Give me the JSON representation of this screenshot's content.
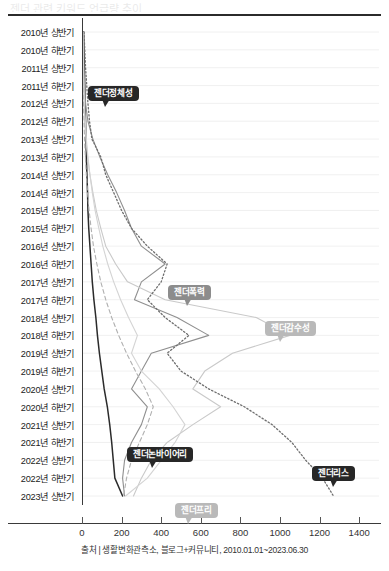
{
  "header": {
    "ghost_title": "젠더 관련 키워드 언급량 추이"
  },
  "source": {
    "text": "출처 | 생활변화관측소, 블로그+커뮤니티, 2010.01.01~2023.06.30"
  },
  "badges": [
    {
      "label": "젠더정체성",
      "style": "dark",
      "x": 88,
      "y": 68,
      "tail_x": 14,
      "tail_dir": "left-down"
    },
    {
      "label": "젠더폭력",
      "style": "mid",
      "x": 168,
      "y": 267,
      "tail_x": 16,
      "tail_dir": "left-down"
    },
    {
      "label": "젠더감수성",
      "style": "light",
      "x": 265,
      "y": 303,
      "tail_x": 12,
      "tail_dir": "left-down"
    },
    {
      "label": "젠더논바이어리",
      "style": "dark",
      "x": 127,
      "y": 429,
      "tail_x": 22,
      "tail_dir": "down"
    },
    {
      "label": "젠더리스",
      "style": "dark",
      "x": 312,
      "y": 448,
      "tail_x": 18,
      "tail_dir": "down"
    },
    {
      "label": "젠더프리",
      "style": "light",
      "x": 175,
      "y": 485,
      "tail_x": 10,
      "tail_dir": "left-up"
    }
  ],
  "chart_data": {
    "type": "line",
    "orientation": "horizontal",
    "title": "",
    "xlabel": "",
    "ylabel": "",
    "xlim": [
      0,
      1500
    ],
    "xticks": [
      0,
      200,
      400,
      600,
      800,
      1000,
      1200,
      1400
    ],
    "xtick_labels": [
      "0",
      "200",
      "400",
      "600",
      "800",
      "1000",
      "1200",
      "1400"
    ],
    "grid": true,
    "grid_axis": "y",
    "legend": "annotations",
    "categories": [
      "2010년 상반기",
      "2010년 하반기",
      "2011년 상반기",
      "2011년 하반기",
      "2012년 상반기",
      "2012년 하반기",
      "2013년 상반기",
      "2013년 하반기",
      "2014년 상반기",
      "2014년 하반기",
      "2015년 상반기",
      "2015년 하반기",
      "2016년 상반기",
      "2016년 하반기",
      "2017년 상반기",
      "2017년 하반기",
      "2018년 상반기",
      "2018년 하반기",
      "2019년 상반기",
      "2019년 하반기",
      "2020년 상반기",
      "2020년 하반기",
      "2021년 상반기",
      "2021년 하반기",
      "2022년 상반기",
      "2022년 하반기",
      "2023년 상반기"
    ],
    "series": [
      {
        "name": "젠더정체성",
        "line_style": "solid",
        "color": "#2b2b2b",
        "width": 1.5,
        "values": [
          8,
          10,
          12,
          14,
          16,
          18,
          20,
          22,
          25,
          28,
          30,
          34,
          40,
          46,
          52,
          60,
          70,
          78,
          88,
          100,
          112,
          128,
          140,
          150,
          158,
          166,
          205
        ]
      },
      {
        "name": "젠더폭력",
        "line_style": "solid",
        "color": "#8f8f8f",
        "width": 1.1,
        "values": [
          6,
          8,
          10,
          13,
          18,
          30,
          55,
          90,
          130,
          175,
          215,
          250,
          300,
          420,
          300,
          265,
          480,
          640,
          350,
          300,
          250,
          330,
          300,
          250,
          215,
          205,
          215
        ]
      },
      {
        "name": "젠더감수성",
        "line_style": "solid",
        "color": "#c9c9c9",
        "width": 1.1,
        "values": [
          4,
          5,
          6,
          8,
          10,
          14,
          20,
          28,
          40,
          55,
          72,
          95,
          120,
          170,
          230,
          420,
          880,
          1050,
          760,
          620,
          560,
          700,
          560,
          430,
          350,
          300,
          260
        ]
      },
      {
        "name": "젠더논바이어리",
        "line_style": "dashed",
        "color": "#b0b0b0",
        "width": 1.1,
        "values": [
          3,
          4,
          5,
          6,
          8,
          10,
          13,
          17,
          22,
          28,
          36,
          46,
          58,
          75,
          95,
          120,
          150,
          185,
          225,
          270,
          320,
          360,
          330,
          290,
          250,
          225,
          210
        ]
      },
      {
        "name": "젠더리스",
        "line_style": "dotted",
        "color": "#6e6e6e",
        "width": 1.3,
        "values": [
          10,
          14,
          18,
          24,
          30,
          38,
          50,
          95,
          120,
          160,
          200,
          250,
          330,
          430,
          400,
          330,
          420,
          540,
          430,
          500,
          640,
          820,
          960,
          1060,
          1130,
          1215,
          1270
        ]
      },
      {
        "name": "젠더프리",
        "line_style": "solid",
        "color": "#d4d4d4",
        "width": 1.1,
        "values": [
          5,
          6,
          8,
          10,
          13,
          17,
          22,
          30,
          40,
          52,
          66,
          85,
          105,
          130,
          160,
          195,
          235,
          280,
          250,
          300,
          390,
          460,
          520,
          470,
          400,
          330,
          220
        ]
      }
    ]
  }
}
